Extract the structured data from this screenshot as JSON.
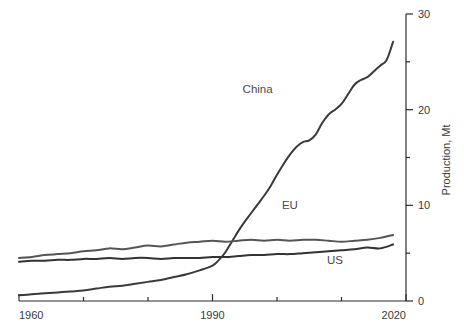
{
  "chart_data": {
    "type": "line",
    "title": "",
    "subtitle": "",
    "xlabel": "",
    "ylabel": "Production, Mt",
    "xlim": [
      1960,
      2020
    ],
    "ylim": [
      0,
      30
    ],
    "grid": false,
    "legend_position": "inline-labels",
    "x_major_ticks": [
      1960,
      1990,
      2020
    ],
    "x_major_tick_labels": [
      "1960",
      "1990",
      "2020"
    ],
    "x_minor_ticks": [
      1970,
      1980,
      2000,
      2010
    ],
    "y_major_ticks": [
      0,
      10,
      20,
      30
    ],
    "y_major_tick_labels": [
      "0",
      "10",
      "20",
      "30"
    ],
    "y_minor_ticks": [
      5,
      15,
      25
    ],
    "y_axis_side": "right",
    "colors": {
      "china": "#3a3a3a",
      "eu": "#555555",
      "us": "#333333",
      "axis": "#2b2b2b",
      "text": "#444444",
      "background": "#ffffff"
    },
    "series": [
      {
        "name": "China",
        "label": "China",
        "color": "#3a3a3a",
        "label_x": 1997,
        "label_y": 21.7,
        "x": [
          1960,
          1962,
          1964,
          1966,
          1968,
          1970,
          1972,
          1974,
          1976,
          1978,
          1980,
          1982,
          1984,
          1986,
          1988,
          1990,
          1991,
          1992,
          1993,
          1994,
          1995,
          1996,
          1997,
          1998,
          1999,
          2000,
          2001,
          2002,
          2003,
          2004,
          2005,
          2006,
          2007,
          2008,
          2009,
          2010,
          2011,
          2012,
          2013,
          2014,
          2015,
          2016,
          2017,
          2018
        ],
        "y": [
          0.6,
          0.7,
          0.8,
          0.9,
          1.0,
          1.1,
          1.3,
          1.5,
          1.6,
          1.8,
          2.0,
          2.2,
          2.5,
          2.8,
          3.2,
          3.7,
          4.3,
          5.1,
          6.2,
          7.3,
          8.3,
          9.2,
          10.1,
          11.0,
          12.0,
          13.2,
          14.3,
          15.3,
          16.1,
          16.6,
          16.8,
          17.4,
          18.6,
          19.5,
          20.0,
          20.6,
          21.6,
          22.6,
          23.1,
          23.4,
          24.0,
          24.6,
          25.2,
          27.1
        ]
      },
      {
        "name": "EU",
        "label": "EU",
        "color": "#555555",
        "label_x": 2002,
        "label_y": 9.6,
        "x": [
          1960,
          1962,
          1964,
          1966,
          1968,
          1970,
          1972,
          1974,
          1976,
          1978,
          1980,
          1982,
          1984,
          1986,
          1988,
          1990,
          1992,
          1994,
          1996,
          1998,
          2000,
          2002,
          2004,
          2006,
          2008,
          2010,
          2012,
          2014,
          2016,
          2018
        ],
        "y": [
          4.5,
          4.6,
          4.8,
          4.9,
          5.0,
          5.2,
          5.3,
          5.5,
          5.4,
          5.6,
          5.8,
          5.7,
          5.9,
          6.1,
          6.2,
          6.3,
          6.2,
          6.3,
          6.4,
          6.3,
          6.4,
          6.3,
          6.4,
          6.4,
          6.3,
          6.2,
          6.3,
          6.4,
          6.6,
          6.9
        ]
      },
      {
        "name": "US",
        "label": "US",
        "color": "#333333",
        "label_x": 2009,
        "label_y": 3.9,
        "x": [
          1960,
          1962,
          1964,
          1966,
          1968,
          1970,
          1972,
          1974,
          1976,
          1978,
          1980,
          1982,
          1984,
          1986,
          1988,
          1990,
          1992,
          1994,
          1996,
          1998,
          2000,
          2002,
          2004,
          2006,
          2008,
          2010,
          2012,
          2014,
          2016,
          2018
        ],
        "y": [
          4.1,
          4.2,
          4.2,
          4.3,
          4.3,
          4.4,
          4.4,
          4.5,
          4.4,
          4.5,
          4.5,
          4.4,
          4.5,
          4.5,
          4.5,
          4.6,
          4.6,
          4.7,
          4.8,
          4.8,
          4.9,
          4.9,
          5.0,
          5.1,
          5.2,
          5.3,
          5.4,
          5.6,
          5.5,
          5.9
        ]
      }
    ]
  }
}
